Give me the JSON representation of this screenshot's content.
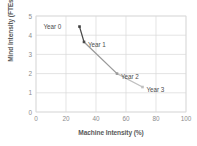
{
  "chart_data": {
    "type": "line",
    "title": "",
    "xlabel": "Machine Intensity (%)",
    "ylabel": "Mind Intensity (FTEs)",
    "xlim": [
      0,
      100
    ],
    "ylim": [
      0,
      5
    ],
    "xticks": [
      "0",
      "20",
      "40",
      "60",
      "80",
      "100"
    ],
    "yticks": [
      "0",
      "1",
      "2",
      "3",
      "4",
      "5"
    ],
    "grid": true,
    "legend": "none",
    "marker_shape": "square",
    "series": [
      {
        "name": "Mind vs Machine Intensity",
        "points": [
          {
            "label": "Year 0",
            "x": 29,
            "y": 4.45,
            "color": "#3f3f3f",
            "label_side": "left"
          },
          {
            "label": "Year 1",
            "x": 32,
            "y": 3.65,
            "color": "#4a4a4a",
            "label_side": "right"
          },
          {
            "label": "Year 2",
            "x": 54,
            "y": 2.0,
            "color": "#9a9a9a",
            "label_side": "right"
          },
          {
            "label": "Year 3",
            "x": 71,
            "y": 1.3,
            "color": "#c0c0c0",
            "label_side": "right"
          }
        ]
      }
    ],
    "colors": {
      "line_start": "#3d3d3d",
      "line_end": "#d0d0d0",
      "grid": "#d9d9d9",
      "axis_text": "#8c8c8c",
      "title_text": "#5a5a5a",
      "plot_border": "#d9d9d9",
      "background": "#ffffff"
    }
  }
}
